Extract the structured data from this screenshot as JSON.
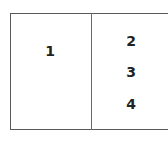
{
  "diagram": {
    "left_panel": {
      "label": "1"
    },
    "right_panel": {
      "items": [
        {
          "label": "2"
        },
        {
          "label": "3"
        },
        {
          "label": "4"
        }
      ]
    },
    "colors": {
      "border": "#5a5a5a",
      "text": "#222222",
      "background": "#ffffff"
    }
  }
}
